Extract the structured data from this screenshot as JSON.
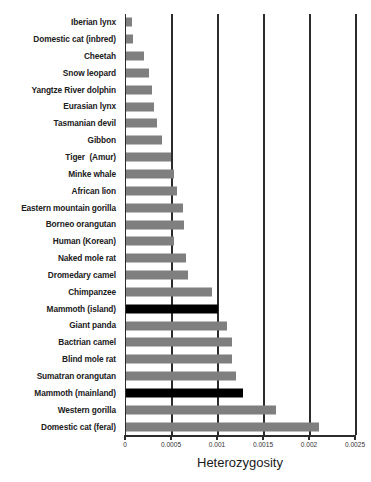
{
  "chart_data": {
    "type": "bar",
    "orientation": "horizontal",
    "title": "",
    "xlabel": "Heterozygosity",
    "ylabel": "",
    "xlim": [
      0,
      0.0025
    ],
    "xticks": [
      0,
      0.0005,
      0.001,
      0.0015,
      0.002,
      0.0025
    ],
    "xticklabels": [
      "0",
      "0.0005",
      "0.001",
      "0.0015",
      "0.002",
      "0.0025"
    ],
    "grid": "vertical",
    "legend": "none",
    "bar_color_default": "#7f7f7f",
    "bar_color_highlight": "#000000",
    "categories": [
      "Iberian lynx",
      "Domestic cat (inbred)",
      "Cheetah",
      "Snow leopard",
      "Yangtze River dolphin",
      "Eurasian lynx",
      "Tasmanian devil",
      "Gibbon",
      "Tiger  (Amur)",
      "Minke whale",
      "African lion",
      "Eastern mountain gorilla",
      "Borneo orangutan",
      "Human (Korean)",
      "Naked mole rat",
      "Dromedary camel",
      "Chimpanzee",
      "Mammoth (island)",
      "Giant panda",
      "Bactrian camel",
      "Blind mole rat",
      "Sumatran orangutan",
      "Mammoth (mainland)",
      "Western gorilla",
      "Domestic cat (feral)"
    ],
    "values": [
      7e-05,
      8e-05,
      0.0002,
      0.00025,
      0.00028,
      0.0003,
      0.00034,
      0.00039,
      0.00049,
      0.00052,
      0.00055,
      0.00062,
      0.00063,
      0.00052,
      0.00065,
      0.00067,
      0.00094,
      0.001,
      0.0011,
      0.00115,
      0.00115,
      0.0012,
      0.00127,
      0.00163,
      0.0021
    ],
    "highlighted": [
      "Mammoth (island)",
      "Mammoth (mainland)"
    ]
  }
}
